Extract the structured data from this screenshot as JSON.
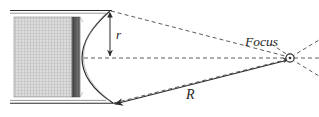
{
  "figure": {
    "type": "parabolic-reflector-diagram",
    "labels": {
      "radius_label": "r",
      "distance_label": "R",
      "focus_label": "Focus"
    },
    "colors": {
      "stroke": "#262626",
      "dashed_stroke": "#4a4a4a",
      "hatch_light": "#d9d9d9",
      "hatch_line": "#9a9a9a",
      "dark_band": "#555555",
      "background": "#ffffff"
    },
    "geometry": {
      "cylinder_top_y": 11,
      "cylinder_bottom_y": 103,
      "cylinder_left_x": 10,
      "block_left_x": 14,
      "block_right_x": 80,
      "dark_band_x": 72,
      "arc_apex_top": [
        110,
        11
      ],
      "arc_apex_bottom": [
        113,
        103
      ],
      "arc_vertex": [
        82,
        58
      ],
      "focus_point": [
        290,
        58
      ],
      "centerline_y": 58
    },
    "elements": {
      "hatched_block_name": "hatched-block",
      "dark_band_name": "dark-band",
      "arc_name": "curved-face-arc",
      "centerline_name": "optical-axis-dashed-line",
      "radius_arrow_name": "radius-arrow",
      "distance_arrow_name": "distance-arrow",
      "focus_marker_name": "focus-point-marker"
    }
  }
}
